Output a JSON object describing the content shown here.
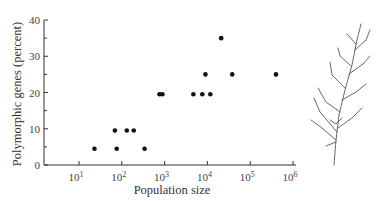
{
  "chart_data": {
    "type": "scatter",
    "title": "",
    "xlabel": "Population size",
    "ylabel": "Polymorphic genes (percent)",
    "x_scale": "log",
    "xlim": [
      3,
      1000000
    ],
    "ylim": [
      0,
      40
    ],
    "x_ticks": [
      {
        "value": 10,
        "base": "10",
        "exp": "1"
      },
      {
        "value": 100,
        "base": "10",
        "exp": "2"
      },
      {
        "value": 1000,
        "base": "10",
        "exp": "3"
      },
      {
        "value": 10000,
        "base": "10",
        "exp": "4"
      },
      {
        "value": 100000,
        "base": "10",
        "exp": "5"
      },
      {
        "value": 1000000,
        "base": "10",
        "exp": "6"
      }
    ],
    "y_ticks": [
      0,
      10,
      20,
      30,
      40
    ],
    "y_minor_ticks": [
      5,
      15,
      25,
      35
    ],
    "grid": false,
    "legend": null,
    "points": [
      {
        "x": 23,
        "y": 4.5
      },
      {
        "x": 69,
        "y": 9.5
      },
      {
        "x": 76,
        "y": 4.5
      },
      {
        "x": 131,
        "y": 9.5
      },
      {
        "x": 190,
        "y": 9.5
      },
      {
        "x": 340,
        "y": 4.5
      },
      {
        "x": 760,
        "y": 19.5
      },
      {
        "x": 890,
        "y": 19.5
      },
      {
        "x": 4700,
        "y": 19.5
      },
      {
        "x": 7600,
        "y": 19.5
      },
      {
        "x": 9000,
        "y": 25
      },
      {
        "x": 11700,
        "y": 19.5
      },
      {
        "x": 21000,
        "y": 35
      },
      {
        "x": 38000,
        "y": 25
      },
      {
        "x": 400000,
        "y": 25
      }
    ],
    "point_color": "#111111",
    "annotation": "illustration of a conifer sprig (plant) to the right of the plot"
  }
}
